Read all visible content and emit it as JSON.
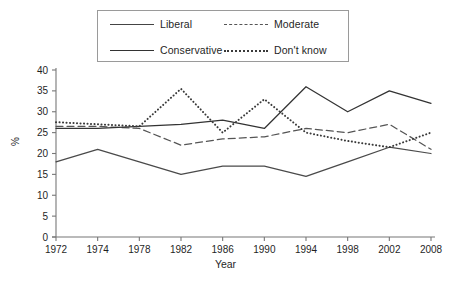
{
  "chart_data": {
    "type": "line",
    "title": "",
    "xlabel": "Year",
    "ylabel": "%",
    "x": [
      "1972",
      "1974",
      "1978",
      "1982",
      "1986",
      "1990",
      "1994",
      "1998",
      "2002",
      "2008"
    ],
    "ylim": [
      0,
      40
    ],
    "yticks": [
      0,
      5,
      10,
      15,
      20,
      25,
      30,
      35,
      40
    ],
    "grid": false,
    "legend_position": "top-center",
    "series": [
      {
        "name": "Liberal",
        "style": "solid",
        "color": "#4a4a4a",
        "values": [
          18,
          21,
          18,
          15,
          17,
          17,
          14.5,
          18,
          21.5,
          20
        ]
      },
      {
        "name": "Moderate",
        "style": "dashed",
        "color": "#555555",
        "values": [
          26.5,
          26.5,
          26,
          22,
          23.5,
          24,
          26,
          25,
          27,
          21
        ]
      },
      {
        "name": "Conservative",
        "style": "solid",
        "color": "#333333",
        "values": [
          26,
          26,
          26.5,
          27,
          28,
          26,
          36,
          30,
          35,
          32
        ]
      },
      {
        "name": "Don't know",
        "style": "dotted",
        "color": "#3a3a3a",
        "values": [
          27.5,
          27,
          26.5,
          35.5,
          25,
          33,
          25,
          23,
          21.5,
          25
        ]
      }
    ]
  },
  "legend": {
    "entries": [
      {
        "label": "Liberal",
        "style": "solid"
      },
      {
        "label": "Moderate",
        "style": "dashed"
      },
      {
        "label": "Conservative",
        "style": "solid"
      },
      {
        "label": "Don't know",
        "style": "dotted"
      }
    ]
  },
  "axes": {
    "x_title": "Year",
    "y_title": "%"
  }
}
